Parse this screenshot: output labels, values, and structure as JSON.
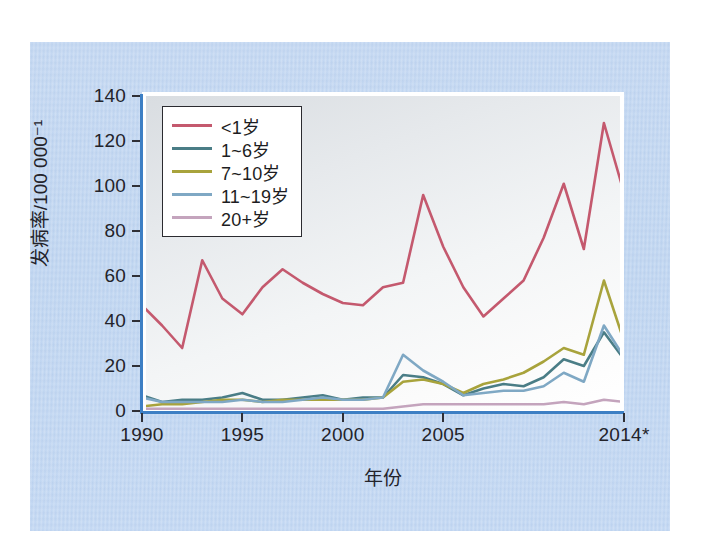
{
  "chart_data": {
    "type": "line",
    "title": "",
    "xlabel": "年份",
    "ylabel": "发病率/100 000⁻¹",
    "xlim": [
      1990,
      2014
    ],
    "ylim": [
      0,
      140
    ],
    "ytick_labels": [
      "0",
      "20",
      "40",
      "60",
      "80",
      "100",
      "120",
      "140"
    ],
    "ytick_values": [
      0,
      20,
      40,
      60,
      80,
      100,
      120,
      140
    ],
    "xtick_labels": [
      "1990",
      "1995",
      "2000",
      "2005",
      "2014*"
    ],
    "xtick_values": [
      1990,
      1995,
      2000,
      2005,
      2014
    ],
    "grid": false,
    "legend_position": "top-left",
    "x": [
      1990,
      1991,
      1992,
      1993,
      1994,
      1995,
      1996,
      1997,
      1998,
      1999,
      2000,
      2001,
      2002,
      2003,
      2004,
      2005,
      2006,
      2007,
      2008,
      2009,
      2010,
      2011,
      2012,
      2013,
      2014
    ],
    "series": [
      {
        "name": "<1岁",
        "color": "#c4596e",
        "values": [
          47,
          38,
          28,
          67,
          50,
          43,
          55,
          63,
          57,
          52,
          48,
          47,
          55,
          57,
          96,
          73,
          55,
          42,
          50,
          58,
          77,
          101,
          72,
          128,
          97
        ]
      },
      {
        "name": "1~6岁",
        "color": "#4a7d86",
        "values": [
          7,
          4,
          5,
          5,
          6,
          8,
          5,
          5,
          6,
          7,
          5,
          6,
          6,
          16,
          15,
          12,
          7,
          10,
          12,
          11,
          15,
          23,
          20,
          35,
          23
        ]
      },
      {
        "name": "7~10岁",
        "color": "#a8a33c",
        "values": [
          2,
          3,
          3,
          4,
          5,
          5,
          4,
          5,
          5,
          5,
          5,
          5,
          6,
          13,
          14,
          12,
          8,
          12,
          14,
          17,
          22,
          28,
          25,
          58,
          31
        ]
      },
      {
        "name": "11~19岁",
        "color": "#7fa8c4",
        "values": [
          6,
          4,
          4,
          4,
          4,
          5,
          4,
          4,
          5,
          6,
          5,
          5,
          6,
          25,
          18,
          13,
          7,
          8,
          9,
          9,
          11,
          17,
          13,
          38,
          24
        ]
      },
      {
        "name": "20+岁",
        "color": "#c4a4bd",
        "values": [
          1,
          1,
          1,
          1,
          1,
          1,
          1,
          1,
          1,
          1,
          1,
          1,
          1,
          2,
          3,
          3,
          3,
          3,
          3,
          3,
          3,
          4,
          3,
          5,
          4
        ]
      }
    ]
  },
  "axes": {
    "y_title": "发病率/100 000⁻¹",
    "x_title": "年份"
  }
}
